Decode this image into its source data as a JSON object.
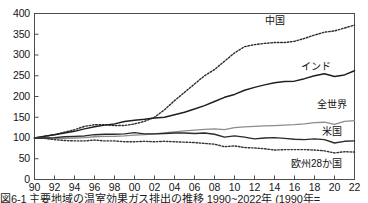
{
  "caption": "図6-1 主要地域の温室効果ガス排出の推移 1990~2022年 (1990年=",
  "axis": {
    "y_ticks": [
      "400",
      "350",
      "300",
      "250",
      "200",
      "150",
      "100",
      "50",
      "0"
    ],
    "x_ticks": [
      "90",
      "92",
      "94",
      "96",
      "98",
      "00",
      "02",
      "04",
      "06",
      "08",
      "10",
      "12",
      "14",
      "16",
      "18",
      "20",
      "22"
    ],
    "ylabel": "",
    "xlabel": ""
  },
  "series_labels": {
    "china": "中国",
    "india": "インド",
    "world": "全世界",
    "usa": "米国",
    "eu28": "欧州28か国"
  },
  "colors": {
    "china": "#2b2b2b",
    "india": "#1f1f1f",
    "world": "#8c8c8c",
    "usa": "#2a2a2a",
    "eu28": "#333333",
    "frame": "#4d4d4d"
  },
  "chart_data": {
    "type": "line",
    "xlabel": "",
    "ylabel": "",
    "xlim": [
      1990,
      2022
    ],
    "ylim": [
      0,
      400
    ],
    "ytick_step": 50,
    "grid": false,
    "legend": "inline-labels",
    "x": [
      1990,
      1991,
      1992,
      1993,
      1994,
      1995,
      1996,
      1997,
      1998,
      1999,
      2000,
      2001,
      2002,
      2003,
      2004,
      2005,
      2006,
      2007,
      2008,
      2009,
      2010,
      2011,
      2012,
      2013,
      2014,
      2015,
      2016,
      2017,
      2018,
      2019,
      2020,
      2021,
      2022
    ],
    "series": [
      {
        "name": "中国",
        "label": "中国",
        "style": "dotted",
        "values": [
          100,
          104,
          108,
          114,
          120,
          128,
          132,
          132,
          130,
          130,
          134,
          140,
          150,
          168,
          190,
          210,
          230,
          250,
          265,
          285,
          305,
          320,
          325,
          328,
          330,
          330,
          333,
          340,
          348,
          355,
          358,
          365,
          372
        ]
      },
      {
        "name": "インド",
        "label": "インド",
        "style": "solid",
        "values": [
          100,
          104,
          108,
          112,
          116,
          122,
          127,
          131,
          134,
          140,
          143,
          145,
          148,
          150,
          156,
          162,
          170,
          178,
          188,
          198,
          205,
          215,
          222,
          228,
          233,
          236,
          237,
          243,
          250,
          255,
          248,
          252,
          262
        ]
      },
      {
        "name": "全世界",
        "label": "全世界",
        "style": "solid-light",
        "values": [
          100,
          100,
          99,
          99,
          100,
          101,
          103,
          104,
          104,
          105,
          107,
          108,
          110,
          112,
          115,
          117,
          119,
          121,
          122,
          120,
          125,
          127,
          128,
          129,
          130,
          131,
          132,
          134,
          137,
          138,
          133,
          140,
          142
        ]
      },
      {
        "name": "米国",
        "label": "米国",
        "style": "solid",
        "values": [
          100,
          100,
          101,
          103,
          104,
          105,
          108,
          109,
          109,
          110,
          113,
          110,
          110,
          111,
          112,
          112,
          111,
          112,
          109,
          102,
          105,
          102,
          98,
          100,
          101,
          99,
          97,
          96,
          98,
          96,
          88,
          92,
          93
        ]
      },
      {
        "name": "欧州28か国",
        "label": "欧州28か国",
        "style": "dotted",
        "values": [
          100,
          99,
          96,
          94,
          93,
          93,
          95,
          93,
          93,
          91,
          91,
          92,
          91,
          92,
          91,
          90,
          89,
          87,
          85,
          79,
          81,
          77,
          76,
          74,
          71,
          72,
          72,
          72,
          71,
          69,
          64,
          67,
          66
        ]
      }
    ]
  }
}
